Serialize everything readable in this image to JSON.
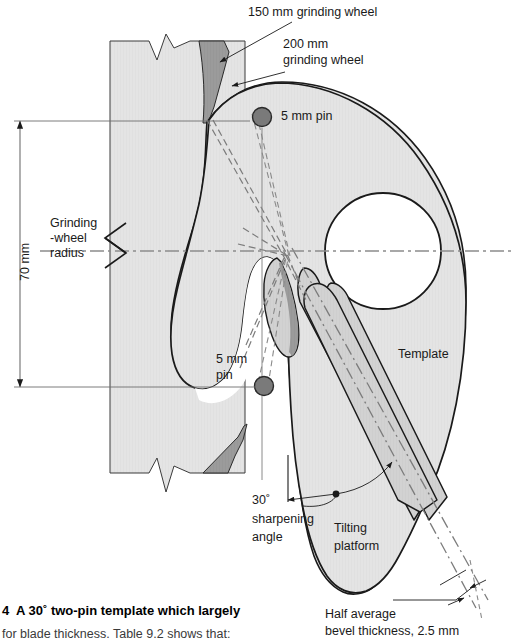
{
  "figure": {
    "title_caption": "4  A 30˚ two-pin template which largely",
    "subcaption": "for blade thickness. Table 9.2 shows that:",
    "labels": {
      "wheel150": "150 mm grinding wheel",
      "wheel200_line1": "200 mm",
      "wheel200_line2": "grinding wheel",
      "pin_top": "5 mm pin",
      "pin_bottom_line1": "5 mm",
      "pin_bottom_line2": "pin",
      "grinding_radius_line1": "Grinding",
      "grinding_radius_line2": "-wheel",
      "grinding_radius_line3": "radius",
      "dim_70mm": "70 mm",
      "template": "Template",
      "angle_line1": "30˚",
      "angle_line2": "sharpening",
      "angle_line3": "angle",
      "tilting_line1": "Tilting",
      "tilting_line2": "platform",
      "bevel_line1": "Half average",
      "bevel_line2": "bevel thickness, 2.5 mm"
    },
    "colors": {
      "body_fill": "#e3e3e3",
      "dark_fill": "#9a9a9a",
      "mid_fill": "#d3d3d3",
      "outline": "#1a1a1a",
      "centerline": "#8c8c8c",
      "dimension_line": "#6e6e6e",
      "background": "#ffffff",
      "text": "#1a1a1a"
    },
    "geometry": {
      "dimension_70mm_top_y": 121,
      "dimension_70mm_bottom_y": 387,
      "centerline_y": 251,
      "pin_top": {
        "cx": 262,
        "cy": 117,
        "r": 9
      },
      "pin_bottom": {
        "cx": 264,
        "cy": 386,
        "r": 9
      },
      "template_hole": {
        "cx": 383,
        "cy": 251,
        "r": 58
      },
      "wheel_block": {
        "x": 110,
        "y": 41,
        "w": 135,
        "h": 432
      }
    }
  }
}
